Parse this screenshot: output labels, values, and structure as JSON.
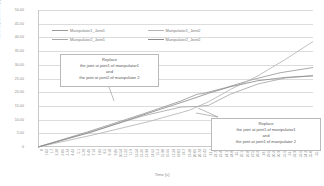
{
  "chart_data": {
    "type": "line",
    "title": "",
    "xlabel": "Time [s]",
    "ylabel": "Joint displacement [s]",
    "grid": true,
    "legend_position": "top-inside",
    "ylim": [
      0,
      50
    ],
    "yticks": [
      "50.00",
      "45.00",
      "40.00",
      "35.00",
      "30.00",
      "25.00",
      "20.00",
      "15.00",
      "10.00",
      "5.00",
      "0"
    ],
    "xticks": [
      "0",
      "1.02",
      "1.7",
      "2.38",
      "3.06",
      "3.74",
      "4.42",
      "5.1",
      "5.78",
      "6.46",
      "7.14",
      "7.82",
      "8.5",
      "9.18",
      "9.86",
      "10.54",
      "11.22",
      "11.9",
      "12.58",
      "13.26",
      "13.94",
      "14.62",
      "15.3",
      "15.98",
      "16.66",
      "17.34",
      "18.02",
      "18.7",
      "19.38",
      "20.06",
      "20.74",
      "21.42",
      "22.1",
      "22.78",
      "23.46",
      "24.14",
      "24.82",
      "25.5",
      "26.18",
      "26.86",
      "27.54",
      "28.22",
      "28.9",
      "29.58",
      "30.26",
      "30.94",
      "31.62",
      "32.3",
      "32.98",
      "33.66",
      "34.34",
      "35.02",
      "35.7"
    ],
    "series": [
      {
        "name": "Manipulator1_Joint1",
        "color": "#9a9a9a",
        "points": [
          [
            0,
            0
          ],
          [
            0.18,
            5.5
          ],
          [
            0.38,
            12.0
          ],
          [
            0.52,
            16.8
          ],
          [
            0.58,
            19.3
          ],
          [
            0.6,
            19.5
          ],
          [
            0.68,
            21.6
          ],
          [
            0.78,
            24.6
          ],
          [
            0.88,
            27.1
          ],
          [
            1.0,
            29.0
          ]
        ]
      },
      {
        "name": "Manipulator1_Joint2",
        "color": "#b5b5b5",
        "points": [
          [
            0,
            0
          ],
          [
            0.2,
            4.4
          ],
          [
            0.4,
            9.2
          ],
          [
            0.55,
            13.4
          ],
          [
            0.62,
            16.5
          ],
          [
            0.7,
            21.0
          ],
          [
            0.8,
            26.0
          ],
          [
            0.9,
            32.0
          ],
          [
            1.0,
            38.5
          ]
        ]
      },
      {
        "name": "Manipulator2_Joint1",
        "color": "#a8a8a8",
        "points": [
          [
            0,
            0
          ],
          [
            0.18,
            5.2
          ],
          [
            0.38,
            11.3
          ],
          [
            0.52,
            14.6
          ],
          [
            0.58,
            14.8
          ],
          [
            0.62,
            15.2
          ],
          [
            0.7,
            19.3
          ],
          [
            0.8,
            23.0
          ],
          [
            0.9,
            25.2
          ],
          [
            1.0,
            26.0
          ]
        ]
      },
      {
        "name": "Manipulator2_Joint2",
        "color": "#8c8c8c",
        "points": [
          [
            0,
            0
          ],
          [
            0.2,
            5.6
          ],
          [
            0.4,
            12.3
          ],
          [
            0.55,
            17.2
          ],
          [
            0.62,
            19.6
          ],
          [
            0.7,
            22.0
          ],
          [
            0.8,
            24.2
          ],
          [
            0.9,
            25.4
          ],
          [
            1.0,
            26.0
          ]
        ]
      }
    ]
  },
  "legend": {
    "items": [
      {
        "label": "Manipulator1_Joint1",
        "color": "#9a9a9a"
      },
      {
        "label": "Manipulator1_Joint2",
        "color": "#b5b5b5"
      },
      {
        "label": "Manipulator2_Joint1",
        "color": "#a8a8a8"
      },
      {
        "label": "Manipulator2_Joint2",
        "color": "#8c8c8c"
      }
    ]
  },
  "annotations": [
    {
      "name": "replace-callout-1",
      "lines": [
        "Replace",
        "the joint at joint1 of manipulator1",
        "and",
        "the joint at joint2 of manipulator 2"
      ]
    },
    {
      "name": "replace-callout-2",
      "lines": [
        "Replace",
        "the joint at joint1 of manipulator1",
        "and",
        "the joint at joint1 of manipulator 2"
      ]
    }
  ]
}
